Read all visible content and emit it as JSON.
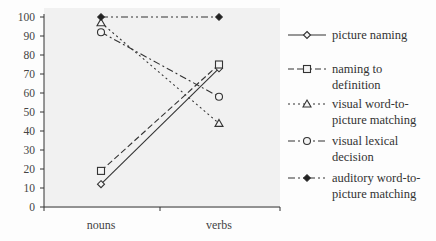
{
  "chart_data": {
    "type": "line",
    "title": "",
    "xlabel": "",
    "ylabel": "",
    "categories": [
      "nouns",
      "verbs"
    ],
    "ylim": [
      0,
      100
    ],
    "yticks": [
      0,
      10,
      20,
      30,
      40,
      50,
      60,
      70,
      80,
      90,
      100
    ],
    "grid": false,
    "legend_position": "right",
    "series": [
      {
        "name": "picture naming",
        "values": [
          12,
          73
        ],
        "marker": "diamond-open",
        "line": "solid"
      },
      {
        "name": "naming to definition",
        "values": [
          19,
          75
        ],
        "marker": "square-open",
        "line": "dashed"
      },
      {
        "name": "visual word-to-picture matching",
        "values": [
          97,
          44
        ],
        "marker": "triangle-open",
        "line": "dotted"
      },
      {
        "name": "visual lexical decision",
        "values": [
          92,
          58
        ],
        "marker": "circle-open",
        "line": "dash-dot"
      },
      {
        "name": "auditory word-to-picture matching",
        "values": [
          100,
          100
        ],
        "marker": "diamond-filled",
        "line": "dash-dot-dot"
      }
    ]
  },
  "legend": [
    {
      "line1": "picture naming",
      "line2": ""
    },
    {
      "line1": "naming to",
      "line2": "definition"
    },
    {
      "line1": "visual word-to-",
      "line2": "picture matching"
    },
    {
      "line1": "visual lexical",
      "line2": "decision"
    },
    {
      "line1": "auditory word-to-",
      "line2": "picture matching"
    }
  ]
}
